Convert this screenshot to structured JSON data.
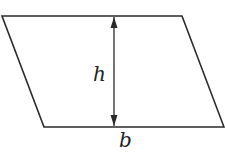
{
  "diagram": {
    "type": "parallelogram",
    "labels": {
      "height": "h",
      "base": "b"
    },
    "colors": {
      "stroke": "#2a2a2a",
      "background": "#ffffff"
    }
  }
}
